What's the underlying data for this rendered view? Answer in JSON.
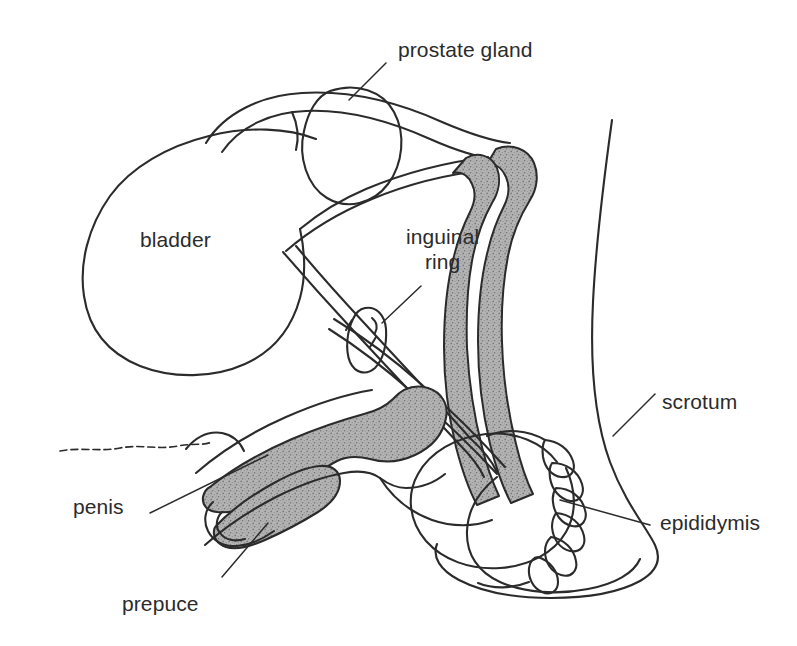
{
  "figure": {
    "background_color": "#ffffff",
    "ink_color": "#2b2b2b",
    "shading_color": "#a9a9a9",
    "width": 797,
    "height": 646
  },
  "labels": {
    "prostate_gland": "prostate gland",
    "bladder": "bladder",
    "inguinal_line1": "inguinal",
    "inguinal_line2": "ring",
    "scrotum": "scrotum",
    "epididymis": "epididymis",
    "penis": "penis",
    "prepuce": "prepuce"
  },
  "parts": [
    {
      "name": "prostate-gland",
      "label": "prostate gland",
      "shaded": false
    },
    {
      "name": "bladder",
      "label": "bladder",
      "shaded": false
    },
    {
      "name": "inguinal-ring",
      "label": "inguinal ring",
      "shaded": false
    },
    {
      "name": "scrotum",
      "label": "scrotum",
      "shaded": false
    },
    {
      "name": "epididymis",
      "label": "epididymis",
      "shaded": false
    },
    {
      "name": "penis",
      "label": "penis",
      "shaded": true
    },
    {
      "name": "prepuce",
      "label": "prepuce",
      "shaded": false
    },
    {
      "name": "vas-deferens",
      "label": "vas deferens",
      "shaded": true
    },
    {
      "name": "seminal-vesicle",
      "label": "seminal vesicle",
      "shaded": true
    },
    {
      "name": "testis",
      "label": "testis",
      "shaded": false
    },
    {
      "name": "abdominal-wall",
      "label": "abdominal wall",
      "shaded": false
    }
  ]
}
